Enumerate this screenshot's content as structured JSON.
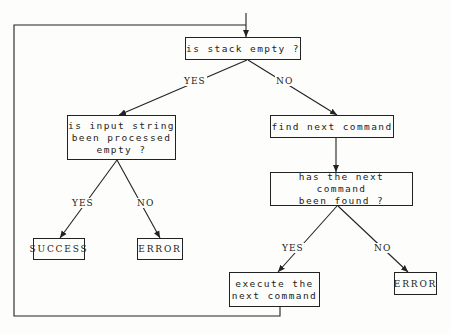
{
  "nodes": {
    "stack_empty": "is stack empty ?",
    "input_empty": "is input string\nbeen processed\nempty ?",
    "find_next": "find next command",
    "found": "has the next command\nbeen found ?",
    "success": "SUCCESS",
    "error_left": "ERROR",
    "execute": "execute the\nnext command",
    "error_right": "ERROR"
  },
  "edges": {
    "stack_yes": "YES",
    "stack_no": "NO",
    "input_yes": "YES",
    "input_no": "NO",
    "found_yes": "YES",
    "found_no": "NO"
  }
}
